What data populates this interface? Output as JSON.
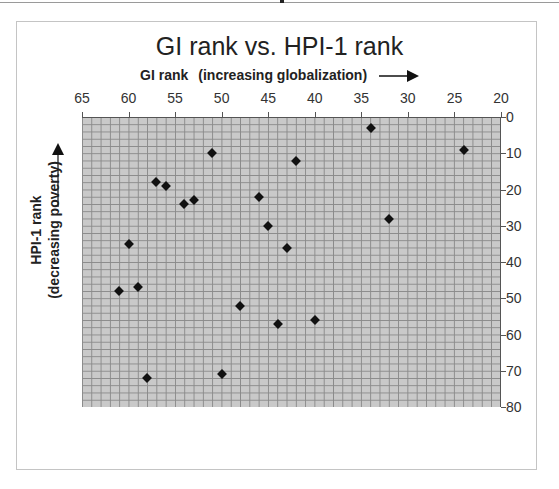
{
  "chart_data": {
    "type": "scatter",
    "title": "GI rank vs. HPI-1 rank",
    "xlabel": "GI rank",
    "xlabel_note": "(increasing globalization)",
    "ylabel": "HPI-1 rank",
    "ylabel_note": "(decreasing poverty)",
    "xlim": [
      65,
      20
    ],
    "ylim": [
      80,
      0
    ],
    "x_axis_reversed": true,
    "y_axis_reversed": true,
    "x_axis_position": "top",
    "y_axis_position": "right",
    "grid": true,
    "legend": null,
    "x_ticks": [
      "65",
      "60",
      "55",
      "50",
      "45",
      "40",
      "35",
      "30",
      "25",
      "20"
    ],
    "y_ticks": [
      "0",
      "10",
      "20",
      "30",
      "40",
      "50",
      "60",
      "70",
      "80"
    ],
    "series": [
      {
        "name": "Countries",
        "marker": "diamond",
        "color": "#111111",
        "points": [
          {
            "x": 34,
            "y": 3
          },
          {
            "x": 24,
            "y": 9
          },
          {
            "x": 51,
            "y": 10
          },
          {
            "x": 42,
            "y": 12
          },
          {
            "x": 57,
            "y": 18
          },
          {
            "x": 56,
            "y": 19
          },
          {
            "x": 46,
            "y": 22
          },
          {
            "x": 53,
            "y": 23
          },
          {
            "x": 54,
            "y": 24
          },
          {
            "x": 32,
            "y": 28
          },
          {
            "x": 45,
            "y": 30
          },
          {
            "x": 60,
            "y": 35
          },
          {
            "x": 43,
            "y": 36
          },
          {
            "x": 59,
            "y": 47
          },
          {
            "x": 61,
            "y": 48
          },
          {
            "x": 48,
            "y": 52
          },
          {
            "x": 40,
            "y": 56
          },
          {
            "x": 44,
            "y": 57
          },
          {
            "x": 50,
            "y": 71
          },
          {
            "x": 58,
            "y": 72
          }
        ]
      }
    ]
  },
  "colors": {
    "plot_background": "#c9c9c9",
    "gridline": "#8a8a8a",
    "marker": "#111111"
  }
}
